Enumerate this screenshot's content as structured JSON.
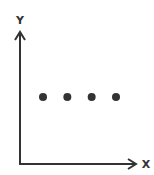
{
  "chart_data": {
    "type": "scatter",
    "title": "",
    "xlabel": "X",
    "ylabel": "Y",
    "grid": false,
    "legend": null,
    "ticks": {
      "x": [],
      "y": []
    },
    "series": [
      {
        "name": "points",
        "x": [
          1,
          2,
          3,
          4
        ],
        "y": [
          1,
          1,
          1,
          1
        ]
      }
    ],
    "colors": {
      "axis": "#333333",
      "points": "#333333"
    }
  }
}
